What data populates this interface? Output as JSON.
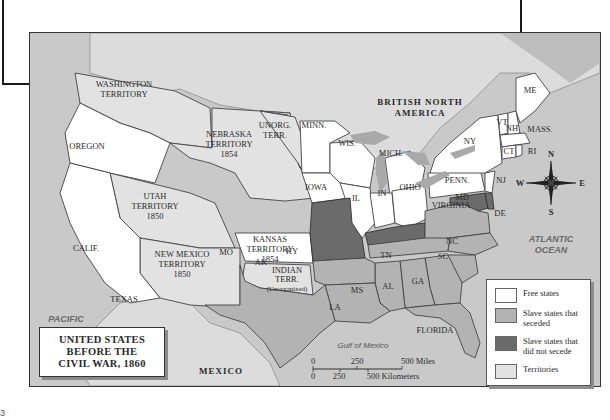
{
  "map": {
    "title_lines": [
      "UNITED STATES",
      "BEFORE THE",
      "CIVIL WAR, 1860"
    ],
    "regions": {
      "british_north_america": [
        "BRITISH NORTH",
        "AMERICA"
      ],
      "mexico": "MEXICO",
      "pacific_ocean": [
        "PACIFIC",
        "OCEAN"
      ],
      "atlantic_ocean": [
        "ATLANTIC",
        "OCEAN"
      ],
      "gulf_of_mexico": "Gulf of Mexico"
    },
    "territories": [
      {
        "id": "washington",
        "lines": [
          "WASHINGTON",
          "TERRITORY"
        ]
      },
      {
        "id": "nebraska",
        "lines": [
          "NEBRASKA",
          "TERRITORY",
          "1854"
        ]
      },
      {
        "id": "unorganized",
        "lines": [
          "UNORG.",
          "TERR."
        ]
      },
      {
        "id": "utah",
        "lines": [
          "UTAH",
          "TERRITORY",
          "1850"
        ]
      },
      {
        "id": "new-mexico",
        "lines": [
          "NEW MEXICO",
          "TERRITORY",
          "1850"
        ]
      },
      {
        "id": "kansas",
        "lines": [
          "KANSAS",
          "TERRITORY",
          "1854"
        ]
      },
      {
        "id": "indian",
        "lines": [
          "INDIAN",
          "TERR.",
          "(Unorganized)"
        ]
      }
    ],
    "free_states": [
      "OREGON",
      "CALIF.",
      "MINN.",
      "IOWA",
      "WIS.",
      "MICH.",
      "IL",
      "IN",
      "OHIO",
      "PENN.",
      "NY",
      "NJ",
      "VT",
      "NH",
      "MASS.",
      "CT",
      "RI",
      "ME"
    ],
    "slave_states_seceded": [
      "TEXAS",
      "AK",
      "LA",
      "MS",
      "AL",
      "GA",
      "FLORIDA",
      "SC",
      "NC",
      "TN",
      "VIRGINIA"
    ],
    "slave_states_not_seceded": [
      "MO",
      "KY",
      "MD",
      "DE"
    ],
    "compass": {
      "n": "N",
      "s": "S",
      "e": "E",
      "w": "W"
    },
    "scale": {
      "miles": [
        "0",
        "250",
        "500 Miles"
      ],
      "km": [
        "0",
        "250",
        "500 Kilometers"
      ]
    },
    "legend": [
      {
        "label": "Free states",
        "color": "#ffffff"
      },
      {
        "label": "Slave states that seceded",
        "color": "#b3b3b3"
      },
      {
        "label": "Slave states that did not secede",
        "color": "#6b6b6b"
      },
      {
        "label": "Territories",
        "color": "#e2e2e2"
      }
    ],
    "colors": {
      "free": "#ffffff",
      "seceded": "#b3b3b3",
      "not_seceded": "#6b6b6b",
      "territory": "#e2e2e2",
      "water": "#c9c9c9",
      "lakes": "#a9a9a9"
    }
  },
  "page_mark": "3"
}
